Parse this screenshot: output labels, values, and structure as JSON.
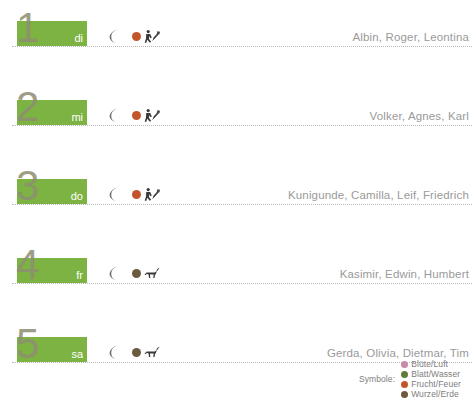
{
  "legend": {
    "title": "Symbole:",
    "entries": [
      {
        "label": "Blüte/Luft",
        "color": "#c98aa8"
      },
      {
        "label": "Blatt/Wasser",
        "color": "#5f7d3a"
      },
      {
        "label": "Frucht/Feuer",
        "color": "#c4552b"
      },
      {
        "label": "Wurzel/Erde",
        "color": "#6b5b3e"
      }
    ]
  },
  "bar_color": "#7cb342",
  "rows": [
    {
      "number": "1",
      "abbr": "di",
      "bar_width": 70,
      "moon_icon": "waning-moon-icon",
      "element_dot_color": "#c4552b",
      "element_name": "frucht-feuer",
      "sign_icon": "sagittarius-archer-icon",
      "names": "Albin, Roger, Leontina"
    },
    {
      "number": "2",
      "abbr": "mi",
      "bar_width": 70,
      "moon_icon": "waning-moon-icon",
      "element_dot_color": "#c4552b",
      "element_name": "frucht-feuer",
      "sign_icon": "sagittarius-archer-icon",
      "names": "Volker, Agnes, Karl"
    },
    {
      "number": "3",
      "abbr": "do",
      "bar_width": 70,
      "moon_icon": "waning-moon-icon",
      "element_dot_color": "#c4552b",
      "element_name": "frucht-feuer",
      "sign_icon": "sagittarius-archer-icon",
      "names": "Kunigunde, Camilla, Leif, Friedrich"
    },
    {
      "number": "4",
      "abbr": "fr",
      "bar_width": 70,
      "moon_icon": "waning-moon-icon",
      "element_dot_color": "#6b5b3e",
      "element_name": "wurzel-erde",
      "sign_icon": "capricorn-goat-icon",
      "names": "Kasimir, Edwin, Humbert"
    },
    {
      "number": "5",
      "abbr": "sa",
      "bar_width": 70,
      "moon_icon": "waning-moon-icon",
      "element_dot_color": "#6b5b3e",
      "element_name": "wurzel-erde",
      "sign_icon": "capricorn-goat-icon",
      "names": "Gerda, Olivia, Dietmar, Tim"
    }
  ]
}
